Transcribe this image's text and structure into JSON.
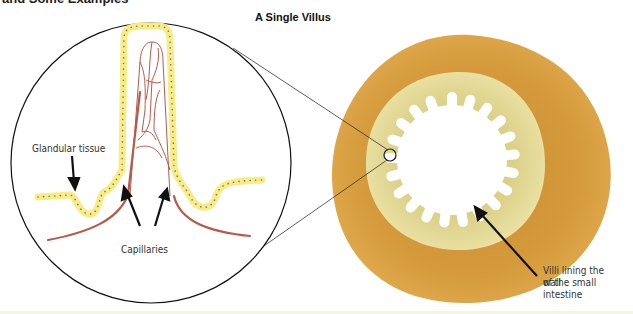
{
  "header": {
    "clipped_heading": "and Some Examples",
    "title": "A Single Villus"
  },
  "labels": {
    "glandular": "Glandular tissue",
    "capillaries": "Capillaries",
    "villi_line1": "Villi lining the wall",
    "villi_line2": "of the small",
    "villi_line3": "intestine"
  },
  "colors": {
    "outer_ring": "#d9a040",
    "inner_ring": "#e6dc94",
    "epithelium": "#f6ec8a",
    "capillary": "#b85a4a",
    "outline": "#111111"
  }
}
